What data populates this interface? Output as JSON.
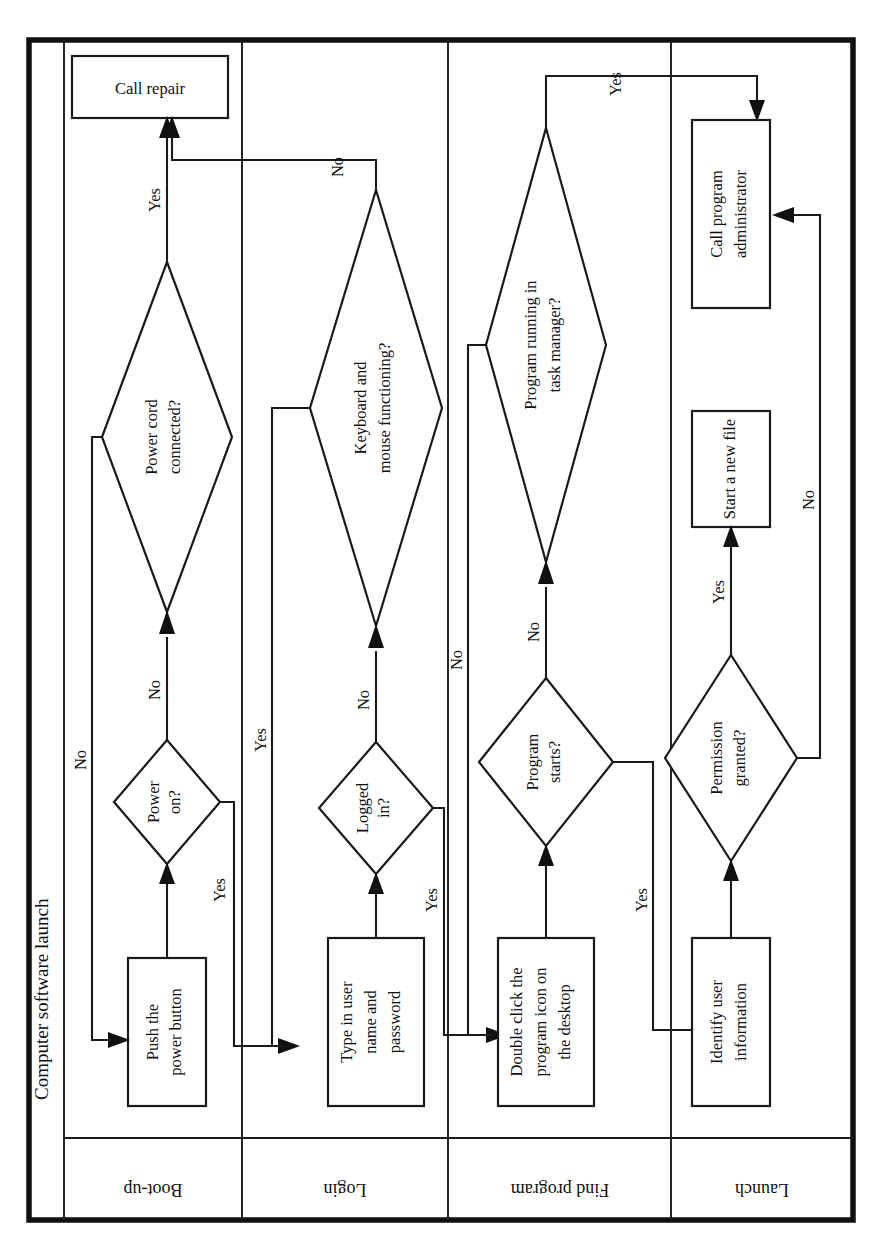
{
  "diagram": {
    "title": "Computer software launch",
    "orientation": "rotated-90-counterclockwise",
    "type": "swimlane-flowchart",
    "lanes": [
      {
        "id": "boot",
        "label": "Boot-up"
      },
      {
        "id": "login",
        "label": "Login"
      },
      {
        "id": "find",
        "label": "Find program"
      },
      {
        "id": "launch",
        "label": "Launch"
      }
    ],
    "nodes": [
      {
        "id": "call-repair",
        "lane": "boot",
        "shape": "process",
        "label": "Call repair"
      },
      {
        "id": "power-cord",
        "lane": "boot",
        "shape": "decision",
        "label": "Power cord\nconnected?",
        "line1": "Power cord",
        "line2": "connected?"
      },
      {
        "id": "power-on",
        "lane": "boot",
        "shape": "decision",
        "label": "Power\non?",
        "line1": "Power",
        "line2": "on?"
      },
      {
        "id": "push-power",
        "lane": "boot",
        "shape": "process",
        "label": "Push the\npower button",
        "line1": "Push the",
        "line2": "power button"
      },
      {
        "id": "keyboard-mouse",
        "lane": "login",
        "shape": "decision",
        "label": "Keyboard and\nmouse functioning?",
        "line1": "Keyboard and",
        "line2": "mouse functioning?"
      },
      {
        "id": "logged-in",
        "lane": "login",
        "shape": "decision",
        "label": "Logged\nin?",
        "line1": "Logged",
        "line2": "in?"
      },
      {
        "id": "type-creds",
        "lane": "login",
        "shape": "process",
        "label": "Type in user\nname and\npassword",
        "line1": "Type in user",
        "line2": "name and",
        "line3": "password"
      },
      {
        "id": "task-manager",
        "lane": "find",
        "shape": "decision",
        "label": "Program running in\ntask manager?",
        "line1": "Program running in",
        "line2": "task manager?"
      },
      {
        "id": "program-starts",
        "lane": "find",
        "shape": "decision",
        "label": "Program\nstarts?",
        "line1": "Program",
        "line2": "starts?"
      },
      {
        "id": "double-click",
        "lane": "find",
        "shape": "process",
        "label": "Double click the\nprogram icon on\nthe desktop",
        "line1": "Double click the",
        "line2": "program icon on",
        "line3": "the desktop"
      },
      {
        "id": "call-admin",
        "lane": "launch",
        "shape": "process",
        "label": "Call program\nadministrator",
        "line1": "Call program",
        "line2": "administrator"
      },
      {
        "id": "new-file",
        "lane": "launch",
        "shape": "process",
        "label": "Start a new file"
      },
      {
        "id": "permission",
        "lane": "launch",
        "shape": "decision",
        "label": "Permission\ngranted?",
        "line1": "Permission",
        "line2": "granted?"
      },
      {
        "id": "identify-user",
        "lane": "launch",
        "shape": "process",
        "label": "Identify user\ninformation",
        "line1": "Identify user",
        "line2": "information"
      }
    ],
    "edges": [
      {
        "id": "e-push-to-poweron",
        "from": "push-power",
        "to": "power-on",
        "label": ""
      },
      {
        "id": "e-poweron-no",
        "from": "power-on",
        "to": "power-cord",
        "label": "No"
      },
      {
        "id": "e-poweron-yes",
        "from": "power-on",
        "to": "type-creds",
        "label": "Yes"
      },
      {
        "id": "e-powercord-yes",
        "from": "power-cord",
        "to": "call-repair",
        "label": "Yes"
      },
      {
        "id": "e-powercord-no",
        "from": "power-cord",
        "to": "push-power",
        "label": "No"
      },
      {
        "id": "e-type-to-logged",
        "from": "type-creds",
        "to": "logged-in",
        "label": ""
      },
      {
        "id": "e-logged-no",
        "from": "logged-in",
        "to": "keyboard-mouse",
        "label": "No"
      },
      {
        "id": "e-logged-yes",
        "from": "logged-in",
        "to": "double-click",
        "label": "Yes"
      },
      {
        "id": "e-keyboard-no",
        "from": "keyboard-mouse",
        "to": "call-repair",
        "label": "No"
      },
      {
        "id": "e-keyboard-yes",
        "from": "keyboard-mouse",
        "to": "type-creds",
        "label": "Yes"
      },
      {
        "id": "e-dblclick-to-starts",
        "from": "double-click",
        "to": "program-starts",
        "label": ""
      },
      {
        "id": "e-starts-no",
        "from": "program-starts",
        "to": "task-manager",
        "label": "No"
      },
      {
        "id": "e-starts-yes",
        "from": "program-starts",
        "to": "identify-user",
        "label": "Yes"
      },
      {
        "id": "e-taskmgr-no",
        "from": "task-manager",
        "to": "double-click",
        "label": "No"
      },
      {
        "id": "e-taskmgr-yes",
        "from": "task-manager",
        "to": "call-admin",
        "label": "Yes"
      },
      {
        "id": "e-identify-to-perm",
        "from": "identify-user",
        "to": "permission",
        "label": ""
      },
      {
        "id": "e-perm-yes",
        "from": "permission",
        "to": "new-file",
        "label": "Yes"
      },
      {
        "id": "e-perm-no",
        "from": "permission",
        "to": "call-admin",
        "label": "No"
      }
    ],
    "edge_labels": {
      "poweron_no": "No",
      "poweron_yes": "Yes",
      "powercord_yes": "Yes",
      "powercord_no": "No",
      "logged_no": "No",
      "logged_yes": "Yes",
      "keyboard_no": "No",
      "keyboard_yes": "Yes",
      "starts_no": "No",
      "starts_yes": "Yes",
      "taskmgr_no": "No",
      "taskmgr_yes": "Yes",
      "perm_yes": "Yes",
      "perm_no": "No"
    },
    "colors": {
      "stroke": "#1a1a1a",
      "fill": "#ffffff",
      "outer_border": "#111111"
    }
  }
}
